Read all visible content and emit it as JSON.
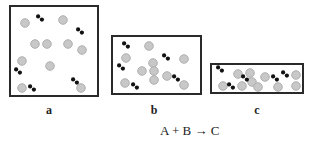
{
  "diagram": {
    "equation": "A + B → C",
    "colors": {
      "border": "#2a2a2a",
      "atom_fill": "#c8c8c8",
      "atom_stroke": "#a9a9a9",
      "molecule": "#111111"
    },
    "legend_semantics": {
      "gray_circle": "atom (reactant particle)",
      "black_dumbbell": "diatomic molecule"
    },
    "containers": [
      {
        "label": "a",
        "box": {
          "x": 9,
          "y": 5,
          "w": 90,
          "h": 92
        },
        "label_pos": {
          "x": 49,
          "y": 104
        },
        "circles": [
          [
            25,
            23
          ],
          [
            63,
            20
          ],
          [
            35,
            44
          ],
          [
            47,
            44
          ],
          [
            68,
            44
          ],
          [
            82,
            50
          ],
          [
            22,
            61
          ],
          [
            50,
            66
          ],
          [
            22,
            88
          ],
          [
            81,
            88
          ]
        ],
        "molecules": [
          [
            40,
            18
          ],
          [
            80,
            31
          ],
          [
            18,
            71
          ],
          [
            32,
            88
          ],
          [
            75,
            81
          ]
        ]
      },
      {
        "label": "b",
        "box": {
          "x": 111,
          "y": 35,
          "w": 91,
          "h": 60
        },
        "label_pos": {
          "x": 154,
          "y": 104
        },
        "circles": [
          [
            149,
            46
          ],
          [
            126,
            58
          ],
          [
            184,
            59
          ],
          [
            153,
            63
          ],
          [
            142,
            71
          ],
          [
            154,
            71
          ],
          [
            154,
            80
          ],
          [
            167,
            76
          ],
          [
            125,
            83
          ],
          [
            184,
            85
          ]
        ],
        "molecules": [
          [
            126,
            45
          ],
          [
            166,
            57
          ],
          [
            121,
            67
          ],
          [
            135,
            86
          ],
          [
            176,
            78
          ]
        ]
      },
      {
        "label": "c",
        "box": {
          "x": 210,
          "y": 63,
          "w": 94,
          "h": 31
        },
        "label_pos": {
          "x": 257,
          "y": 104
        },
        "circles": [
          [
            238,
            74
          ],
          [
            250,
            73
          ],
          [
            252,
            82
          ],
          [
            242,
            86
          ],
          [
            223,
            86
          ],
          [
            258,
            87
          ],
          [
            265,
            77
          ],
          [
            278,
            87
          ],
          [
            296,
            75
          ],
          [
            296,
            86
          ]
        ],
        "molecules": [
          [
            220,
            69
          ],
          [
            245,
            78
          ],
          [
            231,
            86
          ],
          [
            275,
            78
          ],
          [
            285,
            74
          ]
        ]
      }
    ]
  }
}
